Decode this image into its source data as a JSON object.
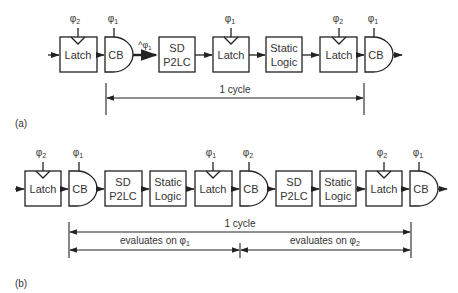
{
  "colors": {
    "stroke": "#222222",
    "text": "#333333",
    "background": "#ffffff"
  },
  "panel_a": {
    "label": "(a)",
    "blocks": [
      {
        "type": "latch",
        "text": [
          "Latch"
        ],
        "clock": "φ",
        "clock_sub": "2"
      },
      {
        "type": "cb",
        "text": [
          "CB"
        ],
        "clock": "φ",
        "clock_sub": "1"
      },
      {
        "type": "box",
        "text": [
          "SD",
          "P2LC"
        ]
      },
      {
        "type": "latch",
        "text": [
          "Latch"
        ],
        "clock": "φ",
        "clock_sub": "1"
      },
      {
        "type": "box",
        "text": [
          "Static",
          "Logic"
        ]
      },
      {
        "type": "latch",
        "text": [
          "Latch"
        ],
        "clock": "φ",
        "clock_sub": "2"
      },
      {
        "type": "cb",
        "text": [
          "CB"
        ],
        "clock": "φ",
        "clock_sub": "1"
      }
    ],
    "thick_wire_label": "^φ",
    "thick_wire_label_sub": "1",
    "span": {
      "label": "1 cycle"
    }
  },
  "panel_b": {
    "label": "(b)",
    "blocks": [
      {
        "type": "latch",
        "text": [
          "Latch"
        ],
        "clock": "φ",
        "clock_sub": "2"
      },
      {
        "type": "cb",
        "text": [
          "CB"
        ],
        "clock": "φ",
        "clock_sub": "1"
      },
      {
        "type": "box",
        "text": [
          "SD",
          "P2LC"
        ]
      },
      {
        "type": "box",
        "text": [
          "Static",
          "Logic"
        ]
      },
      {
        "type": "latch",
        "text": [
          "Latch"
        ],
        "clock": "φ",
        "clock_sub": "1"
      },
      {
        "type": "cb",
        "text": [
          "CB"
        ],
        "clock": "φ",
        "clock_sub": "2"
      },
      {
        "type": "box",
        "text": [
          "SD",
          "P2LC"
        ]
      },
      {
        "type": "box",
        "text": [
          "Static",
          "Logic"
        ]
      },
      {
        "type": "latch",
        "text": [
          "Latch"
        ],
        "clock": "φ",
        "clock_sub": "2"
      },
      {
        "type": "cb",
        "text": [
          "CB"
        ],
        "clock": "φ",
        "clock_sub": "1"
      }
    ],
    "spans": [
      {
        "label": "1 cycle"
      },
      {
        "label": "evaluates on φ",
        "sub": "1"
      },
      {
        "label": "evaluates on φ",
        "sub": "2"
      }
    ]
  }
}
